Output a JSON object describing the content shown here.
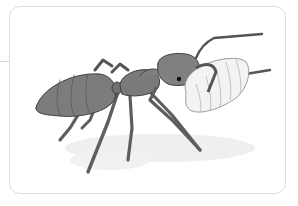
{
  "illustration": {
    "subject": "Ant carrying a larva",
    "colors": {
      "ant_body": "#7a7a7a",
      "ant_dark": "#4a4a4a",
      "ant_light": "#9a9a9a",
      "larva": "#f2f2f2",
      "larva_lines": "#a8a8a8",
      "shadow": "#ececec",
      "frame_border": "#dcdcdc"
    }
  }
}
